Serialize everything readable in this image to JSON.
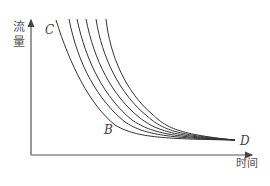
{
  "diagram": {
    "type": "flow-recession-curves",
    "y_axis_label": "流量",
    "x_axis_label": "时间",
    "points": {
      "C": "C",
      "B": "B",
      "D": "D"
    },
    "curve_count": 6,
    "line_color": "#333333",
    "axis_color": "#555555"
  }
}
